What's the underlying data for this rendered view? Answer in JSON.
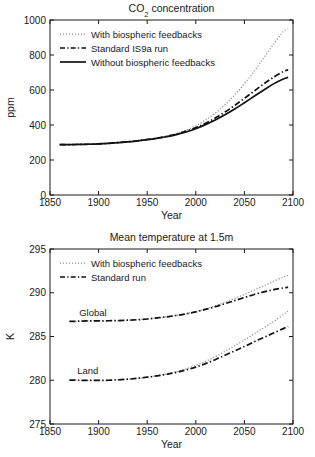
{
  "figure": {
    "background": "#ffffff",
    "ink": "#1a1a1a",
    "accent_gray": "#8c8c8c"
  },
  "chart_data": [
    {
      "id": "co2",
      "type": "line",
      "title": "CO2 concentration",
      "title_parts": {
        "pre": "CO",
        "sub": "2",
        "post": " concentration"
      },
      "xlabel": "Year",
      "ylabel": "ppm",
      "xlim": [
        1850,
        2100
      ],
      "ylim": [
        0,
        1000
      ],
      "xticks": [
        1850,
        1900,
        1950,
        2000,
        2050,
        2100
      ],
      "xticklabels": [
        "1850",
        "1900",
        "1950",
        "2000",
        "2050",
        "2100"
      ],
      "yticks": [
        0,
        200,
        400,
        600,
        800,
        1000
      ],
      "yticklabels": [
        "0",
        "200",
        "400",
        "600",
        "800",
        "1000"
      ],
      "grid": false,
      "legend_position": "upper-left",
      "x": [
        1860,
        1870,
        1880,
        1890,
        1900,
        1910,
        1920,
        1930,
        1940,
        1950,
        1960,
        1970,
        1980,
        1990,
        2000,
        2010,
        2020,
        2030,
        2040,
        2050,
        2060,
        2070,
        2080,
        2090,
        2095
      ],
      "series": [
        {
          "name": "With biospheric feedbacks",
          "style": "dotted",
          "color": "#8c8c8c",
          "values": [
            288,
            288,
            289,
            290,
            292,
            295,
            299,
            304,
            310,
            317,
            326,
            337,
            352,
            371,
            396,
            428,
            468,
            516,
            572,
            636,
            707,
            784,
            862,
            934,
            950
          ]
        },
        {
          "name": "Standard IS9a run",
          "style": "dash-dot",
          "color": "#111111",
          "values": [
            288,
            288,
            289,
            290,
            292,
            295,
            299,
            304,
            310,
            317,
            325,
            335,
            348,
            365,
            385,
            410,
            440,
            474,
            512,
            552,
            594,
            635,
            673,
            705,
            715
          ]
        },
        {
          "name": "Without biospheric feedbacks",
          "style": "solid",
          "color": "#111111",
          "values": [
            288,
            288,
            289,
            290,
            292,
            295,
            299,
            303,
            309,
            316,
            324,
            333,
            345,
            360,
            379,
            402,
            428,
            458,
            491,
            527,
            564,
            600,
            635,
            663,
            672
          ]
        }
      ]
    },
    {
      "id": "temperature",
      "type": "line",
      "title": "Mean temperature at 1.5m",
      "xlabel": "Year",
      "ylabel": "K",
      "xlim": [
        1850,
        2100
      ],
      "ylim": [
        275,
        295
      ],
      "xticks": [
        1850,
        1900,
        1950,
        2000,
        2050,
        2100
      ],
      "xticklabels": [
        "1850",
        "1900",
        "1950",
        "2000",
        "2050",
        "2100"
      ],
      "yticks": [
        275,
        280,
        285,
        290,
        295
      ],
      "yticklabels": [
        "275",
        "280",
        "285",
        "290",
        "295"
      ],
      "grid": false,
      "legend_position": "upper-left",
      "annotations": [
        {
          "text": "Global",
          "x": 1880,
          "y": 287.3
        },
        {
          "text": "Land",
          "x": 1878,
          "y": 280.75
        }
      ],
      "x": [
        1870,
        1880,
        1890,
        1900,
        1910,
        1920,
        1930,
        1940,
        1950,
        1960,
        1970,
        1980,
        1990,
        2000,
        2010,
        2020,
        2030,
        2040,
        2050,
        2060,
        2070,
        2080,
        2090,
        2095
      ],
      "series": [
        {
          "name": "Global — With biospheric feedbacks",
          "group": "Global",
          "style": "dotted",
          "color": "#8c8c8c",
          "values": [
            286.72,
            286.75,
            286.78,
            286.78,
            286.8,
            286.82,
            286.86,
            286.92,
            287.0,
            287.12,
            287.25,
            287.4,
            287.6,
            287.85,
            288.15,
            288.5,
            288.9,
            289.35,
            289.8,
            290.3,
            290.8,
            291.3,
            291.8,
            292.0
          ]
        },
        {
          "name": "Global — Standard run",
          "group": "Global",
          "style": "dash-dot",
          "color": "#111111",
          "values": [
            286.72,
            286.75,
            286.78,
            286.78,
            286.8,
            286.82,
            286.86,
            286.92,
            287.0,
            287.12,
            287.25,
            287.4,
            287.58,
            287.82,
            288.1,
            288.4,
            288.75,
            289.1,
            289.45,
            289.8,
            290.1,
            290.35,
            290.55,
            290.62
          ]
        },
        {
          "name": "Land — With biospheric feedbacks",
          "group": "Land",
          "style": "dotted",
          "color": "#8c8c8c",
          "values": [
            280.02,
            280.0,
            279.98,
            279.98,
            280.0,
            280.05,
            280.12,
            280.22,
            280.35,
            280.52,
            280.72,
            280.98,
            281.3,
            281.7,
            282.15,
            282.7,
            283.3,
            283.95,
            284.6,
            285.3,
            286.0,
            286.7,
            287.5,
            287.9
          ]
        },
        {
          "name": "Land — Standard run",
          "group": "Land",
          "style": "dash-dot",
          "color": "#111111",
          "values": [
            280.02,
            280.0,
            279.98,
            279.98,
            280.0,
            280.05,
            280.12,
            280.22,
            280.35,
            280.5,
            280.68,
            280.9,
            281.18,
            281.5,
            281.9,
            282.35,
            282.85,
            283.35,
            283.85,
            284.4,
            284.9,
            285.4,
            285.9,
            286.15
          ]
        }
      ],
      "legend_entries": [
        {
          "label": "With biospheric feedbacks",
          "style": "dotted"
        },
        {
          "label": "Standard run",
          "style": "dash-dot"
        }
      ]
    }
  ]
}
